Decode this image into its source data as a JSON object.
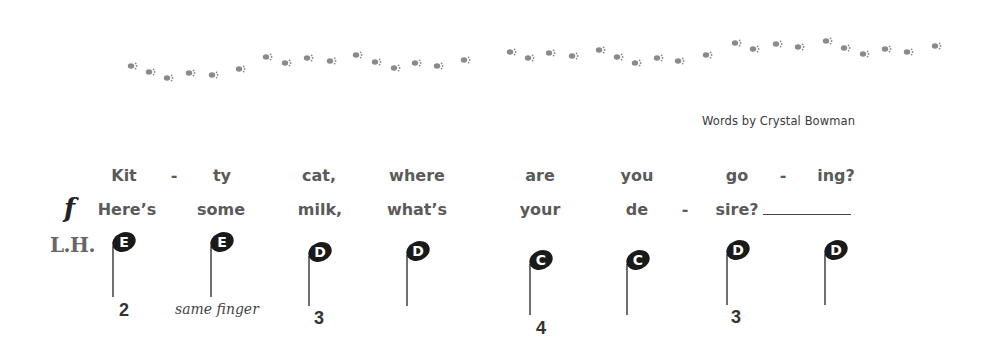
{
  "page": {
    "credit": "Words by Crystal Bowman",
    "dynamic_marking": "f",
    "hand_label": "L.H.",
    "paw_color": "#8a8a8a",
    "note_color": "#1a1a1a"
  },
  "lyrics": {
    "verse1": [
      "Kit",
      "-",
      "ty",
      "cat,",
      "where",
      "are",
      "you",
      "go",
      "-",
      "ing?"
    ],
    "verse2": [
      "Here’s",
      "some",
      "milk,",
      "what’s",
      "your",
      "de",
      "-",
      "sire?"
    ]
  },
  "notes": [
    {
      "name": "E",
      "finger": "2"
    },
    {
      "name": "E",
      "finger": "",
      "hint": "same finger"
    },
    {
      "name": "D",
      "finger": "3"
    },
    {
      "name": "D",
      "finger": ""
    },
    {
      "name": "C",
      "finger": "4"
    },
    {
      "name": "C",
      "finger": ""
    },
    {
      "name": "D",
      "finger": "3"
    },
    {
      "name": "D",
      "finger": ""
    }
  ],
  "hint_text": "same finger",
  "paw_count": 36
}
